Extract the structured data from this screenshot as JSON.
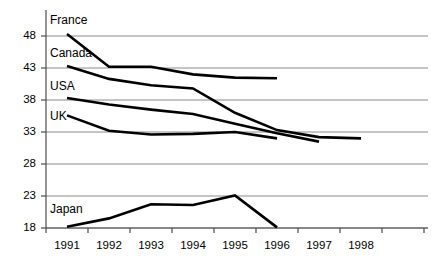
{
  "chart_data": {
    "type": "line",
    "title": "",
    "subtitle": "",
    "xlabel": "",
    "ylabel": "",
    "categories": [
      "1991",
      "1992",
      "1993",
      "1994",
      "1995",
      "1996",
      "1997",
      "1998"
    ],
    "ylim": [
      18,
      50
    ],
    "xlim": [
      "1991",
      "1998"
    ],
    "yticks": [
      18,
      23,
      28,
      33,
      38,
      43,
      48
    ],
    "grid": "horizontal",
    "legend_position": "inline-labels-left",
    "line_color": "#000000",
    "grid_color": "#808080",
    "axis_color": "#5a5a5a",
    "background": "#ffffff",
    "series": [
      {
        "name": "France",
        "label": "France",
        "x": [
          "1991",
          "1992",
          "1993",
          "1994",
          "1995",
          "1996"
        ],
        "values": [
          48.3,
          43.2,
          43.2,
          42.0,
          41.5,
          41.4
        ]
      },
      {
        "name": "Canada",
        "label": "Canada",
        "x": [
          "1991",
          "1992",
          "1993",
          "1994",
          "1995",
          "1996",
          "1997",
          "1998"
        ],
        "values": [
          43.3,
          41.3,
          40.3,
          39.8,
          36.0,
          33.3,
          32.2,
          32.0
        ]
      },
      {
        "name": "USA",
        "label": "USA",
        "x": [
          "1991",
          "1992",
          "1993",
          "1994",
          "1995",
          "1996",
          "1997"
        ],
        "values": [
          38.3,
          37.3,
          36.5,
          35.8,
          34.3,
          32.8,
          31.5
        ]
      },
      {
        "name": "UK",
        "label": "UK",
        "x": [
          "1991",
          "1992",
          "1993",
          "1994",
          "1995",
          "1996"
        ],
        "values": [
          35.6,
          33.2,
          32.6,
          32.7,
          33.0,
          32.0
        ]
      },
      {
        "name": "Japan",
        "label": "Japan",
        "x": [
          "1991",
          "1992",
          "1993",
          "1994",
          "1995",
          "1996"
        ],
        "values": [
          18.2,
          19.5,
          21.7,
          21.6,
          23.1,
          18.1
        ]
      }
    ]
  },
  "axes": {
    "ytick_labels": [
      "48",
      "43",
      "38",
      "33",
      "28",
      "23",
      "18"
    ],
    "xtick_labels": [
      "1991",
      "1992",
      "1993",
      "1994",
      "1995",
      "1996",
      "1997",
      "1998"
    ]
  },
  "series_labels": {
    "france": "France",
    "canada": "Canada",
    "usa": "USA",
    "uk": "UK",
    "japan": "Japan"
  }
}
